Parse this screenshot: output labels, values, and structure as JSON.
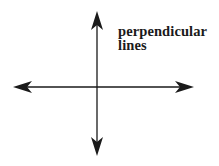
{
  "diagram": {
    "title": "perpendicular lines",
    "label_lines": [
      "perpendicular",
      "lines"
    ],
    "line_color": "#1a1a1a",
    "background": "#ffffff",
    "elements": [
      {
        "type": "line-with-arrows",
        "orientation": "vertical",
        "x": 97,
        "y_start": 12,
        "y_end": 155
      },
      {
        "type": "line-with-arrows",
        "orientation": "horizontal",
        "y": 87,
        "x_start": 14,
        "x_end": 193
      }
    ],
    "intersection": {
      "x": 97,
      "y": 87,
      "angle_degrees": 90
    }
  }
}
